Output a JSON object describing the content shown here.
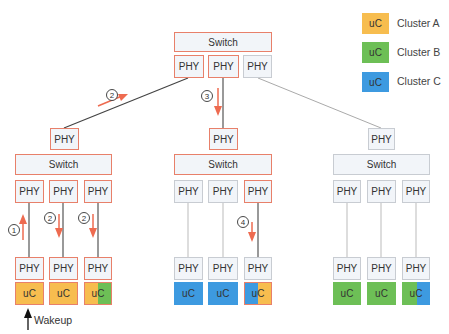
{
  "colors": {
    "cluster_a": "#f7bd4f",
    "cluster_b": "#6dbf56",
    "cluster_c": "#3d9ae0",
    "highlight_border": "#e8806a",
    "normal_border": "#c8ccd2",
    "arrow": "#ee6b50"
  },
  "legend": [
    {
      "box_label": "uC",
      "label": "Cluster A",
      "color": "#f7bd4f"
    },
    {
      "box_label": "uC",
      "label": "Cluster B",
      "color": "#6dbf56"
    },
    {
      "box_label": "uC",
      "label": "Cluster C",
      "color": "#3d9ae0"
    }
  ],
  "top": {
    "switch_label": "Switch",
    "phys": [
      "PHY",
      "PHY",
      "PHY"
    ]
  },
  "branches": [
    {
      "uplink_phy": "PHY",
      "switch_label": "Switch",
      "ports": [
        {
          "phy_top": "PHY",
          "phy_bottom": "PHY",
          "uc": "uC",
          "uc_colors": [
            "#f7bd4f"
          ]
        },
        {
          "phy_top": "PHY",
          "phy_bottom": "PHY",
          "uc": "uC",
          "uc_colors": [
            "#f7bd4f"
          ]
        },
        {
          "phy_top": "PHY",
          "phy_bottom": "PHY",
          "uc": "uC",
          "uc_colors": [
            "#f7bd4f",
            "#6dbf56"
          ]
        }
      ]
    },
    {
      "uplink_phy": "PHY",
      "switch_label": "Switch",
      "ports": [
        {
          "phy_top": "PHY",
          "phy_bottom": "PHY",
          "uc": "uC",
          "uc_colors": [
            "#3d9ae0"
          ]
        },
        {
          "phy_top": "PHY",
          "phy_bottom": "PHY",
          "uc": "uC",
          "uc_colors": [
            "#3d9ae0"
          ]
        },
        {
          "phy_top": "PHY",
          "phy_bottom": "PHY",
          "uc": "uC",
          "uc_colors": [
            "#3d9ae0",
            "#f7bd4f"
          ]
        }
      ]
    },
    {
      "uplink_phy": "PHY",
      "switch_label": "Switch",
      "ports": [
        {
          "phy_top": "PHY",
          "phy_bottom": "PHY",
          "uc": "uC",
          "uc_colors": [
            "#6dbf56"
          ]
        },
        {
          "phy_top": "PHY",
          "phy_bottom": "PHY",
          "uc": "uC",
          "uc_colors": [
            "#6dbf56"
          ]
        },
        {
          "phy_top": "PHY",
          "phy_bottom": "PHY",
          "uc": "uC",
          "uc_colors": [
            "#6dbf56",
            "#3d9ae0"
          ]
        }
      ]
    }
  ],
  "steps": {
    "s1": "1",
    "s2": "2",
    "s3": "3",
    "s4": "4"
  },
  "wakeup_label": "Wakeup"
}
